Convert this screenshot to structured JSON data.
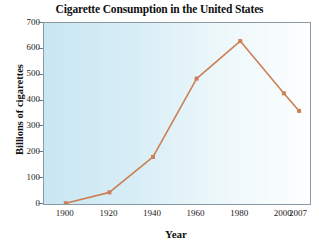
{
  "chart_data": {
    "type": "line",
    "title": "Cigarette Consumption in the United States",
    "xlabel": "Year",
    "ylabel": "Billions of cigarettes",
    "x": [
      1900,
      1920,
      1940,
      1960,
      1980,
      2000,
      2007
    ],
    "values": [
      3,
      45,
      182,
      485,
      630,
      428,
      360
    ],
    "xtick_labels": [
      "1900",
      "1920",
      "1940",
      "1960",
      "1980",
      "2000",
      "2007"
    ],
    "ytick_labels": [
      "0",
      "100",
      "200",
      "300",
      "400",
      "500",
      "600",
      "700"
    ],
    "ytick_values": [
      0,
      100,
      200,
      300,
      400,
      500,
      600,
      700
    ],
    "xlim": [
      1890,
      2012
    ],
    "ylim": [
      0,
      700
    ],
    "grid": false,
    "legend": null,
    "series": [
      {
        "name": "Cigarette consumption",
        "values": [
          3,
          45,
          182,
          485,
          630,
          428,
          360
        ]
      }
    ],
    "line_color": "#cd7f55",
    "marker_color": "#cd7f55",
    "marker": "square",
    "plot_background_left": "#c8e7f2",
    "plot_background_right": "#fdfeff",
    "frame_color": "#8e9aa3",
    "text_color": "#111111"
  }
}
